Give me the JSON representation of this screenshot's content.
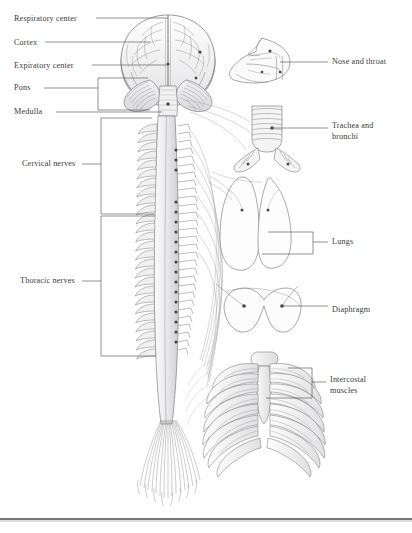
{
  "figure": {
    "background_color": "#ffffff",
    "ink_color": "#5a5a5a",
    "leader_color": "#555555",
    "text_color": "#3b3b3b",
    "bottom_rule_color": "#4a4a4a"
  },
  "labels_left": [
    {
      "text": "Respiratory center",
      "x": 14,
      "y": 16,
      "leader": "line"
    },
    {
      "text": "Cortex",
      "x": 14,
      "y": 40,
      "leader": "line"
    },
    {
      "text": "Expiratory center",
      "x": 14,
      "y": 63,
      "leader": "line"
    },
    {
      "text": "Pons",
      "x": 14,
      "y": 85,
      "leader": "bracket"
    },
    {
      "text": "Medulla",
      "x": 14,
      "y": 109,
      "leader": "line"
    },
    {
      "text": "Cervical nerves",
      "x": 22,
      "y": 162,
      "leader": "bracket"
    },
    {
      "text": "Thoracic nerves",
      "x": 20,
      "y": 279,
      "leader": "bracket"
    }
  ],
  "labels_right": [
    {
      "text": "Nose and throat",
      "x": 332,
      "y": 60,
      "leader": "line"
    },
    {
      "text": "Trachea and",
      "text2": "bronchi",
      "x": 332,
      "y": 124,
      "leader": "line"
    },
    {
      "text": "Lungs",
      "x": 332,
      "y": 240,
      "leader": "bracket"
    },
    {
      "text": "Diaphragm",
      "x": 332,
      "y": 308,
      "leader": "line"
    },
    {
      "text": "Intercostal",
      "text2": "muscles",
      "x": 330,
      "y": 378,
      "leader": "bracket"
    }
  ],
  "anatomy_parts": [
    {
      "name": "brain",
      "description": "cerebral hemispheres viewed posteriorly with cerebellum and brainstem"
    },
    {
      "name": "spinal-cord",
      "description": "vertebral column with segmental spinal nerve roots"
    },
    {
      "name": "cauda-equina",
      "description": "fanning lumbar and sacral nerve fibers"
    },
    {
      "name": "head-sagittal",
      "description": "nasal cavity and pharynx section"
    },
    {
      "name": "trachea-bronchi",
      "description": "cartilage-ringed trachea bifurcating into main bronchi"
    },
    {
      "name": "lungs",
      "description": "right and left lung outlines"
    },
    {
      "name": "diaphragm",
      "description": "domed diaphragm muscle"
    },
    {
      "name": "ribcage",
      "description": "rib cage with sternum and intercostal muscles"
    }
  ]
}
